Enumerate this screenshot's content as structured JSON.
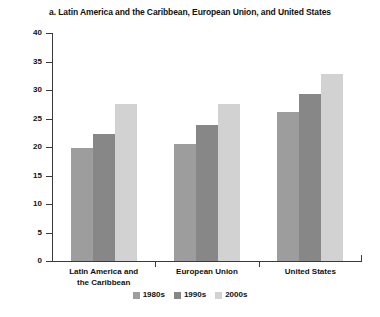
{
  "chart_data": {
    "type": "bar",
    "title": "a. Latin America and the Caribbean, European Union, and United States",
    "xlabel": "",
    "ylabel": "Percent",
    "ylim": [
      0,
      40
    ],
    "yticks": [
      0,
      5,
      10,
      15,
      20,
      25,
      30,
      35,
      40
    ],
    "grid": false,
    "legend_position": "bottom",
    "categories": [
      "Latin America and the Caribbean",
      "European Union",
      "United States"
    ],
    "category_lines": [
      [
        "Latin America and",
        "the Caribbean"
      ],
      [
        "European Union"
      ],
      [
        "United States"
      ]
    ],
    "series": [
      {
        "name": "1980s",
        "color": "#9d9d9d",
        "values": [
          19.8,
          20.6,
          26.2
        ]
      },
      {
        "name": "1990s",
        "color": "#878787",
        "values": [
          22.3,
          23.8,
          29.3
        ]
      },
      {
        "name": "2000s",
        "color": "#d2d2d2",
        "values": [
          27.5,
          27.6,
          32.8
        ]
      }
    ]
  }
}
